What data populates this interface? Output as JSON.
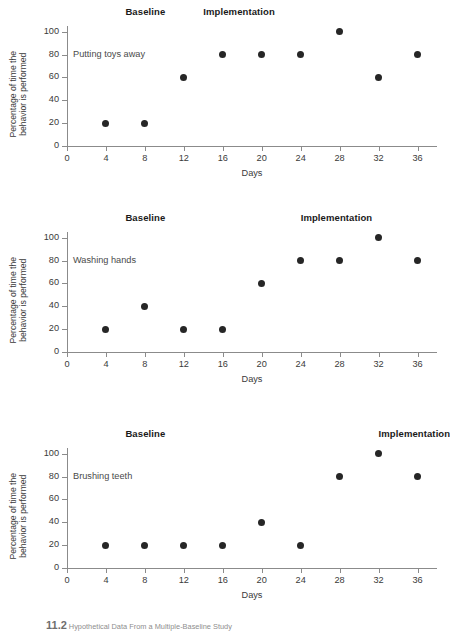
{
  "figure": {
    "caption_number": "11.2",
    "caption_text": "Hypothetical Data From a Multiple-Baseline Study"
  },
  "axes": {
    "xlabel": "Days",
    "ylabel_line1": "Percentage of time the",
    "ylabel_line2": "behavior is performed",
    "xticks": [
      0,
      4,
      8,
      12,
      16,
      20,
      24,
      28,
      32,
      36
    ],
    "yticks": [
      0,
      20,
      40,
      60,
      80,
      100
    ],
    "xlim": [
      0,
      38
    ],
    "ylim": [
      0,
      105
    ],
    "axis_color": "#8b8b8b",
    "marker_color": "#262626"
  },
  "phase_labels": {
    "baseline": "Baseline",
    "implementation": "Implementation"
  },
  "chart_data": [
    {
      "type": "scatter",
      "title": "Putting toys away",
      "xlabel": "Days",
      "ylabel": "Percentage of time the behavior is performed",
      "xlim": [
        0,
        38
      ],
      "ylim": [
        0,
        105
      ],
      "grid": false,
      "legend": "none",
      "x": [
        4,
        8,
        12,
        16,
        20,
        24,
        28,
        32,
        36
      ],
      "values": [
        20,
        20,
        60,
        80,
        80,
        80,
        100,
        60,
        80
      ],
      "annotations": {
        "baseline": "Baseline",
        "implementation": "Implementation",
        "baseline_x": 6,
        "implementation_x": 14
      }
    },
    {
      "type": "scatter",
      "title": "Washing hands",
      "xlabel": "Days",
      "ylabel": "Percentage of time the behavior is performed",
      "xlim": [
        0,
        38
      ],
      "ylim": [
        0,
        105
      ],
      "grid": false,
      "legend": "none",
      "x": [
        4,
        8,
        12,
        16,
        20,
        24,
        28,
        32,
        36
      ],
      "values": [
        20,
        40,
        20,
        20,
        60,
        80,
        80,
        100,
        80
      ],
      "annotations": {
        "baseline": "Baseline",
        "implementation": "Implementation",
        "baseline_x": 6,
        "implementation_x": 24
      }
    },
    {
      "type": "scatter",
      "title": "Brushing teeth",
      "xlabel": "Days",
      "ylabel": "Percentage of time the behavior is performed",
      "xlim": [
        0,
        38
      ],
      "ylim": [
        0,
        105
      ],
      "grid": false,
      "legend": "none",
      "x": [
        4,
        8,
        12,
        16,
        20,
        24,
        28,
        32,
        36
      ],
      "values": [
        20,
        20,
        20,
        20,
        40,
        20,
        80,
        100,
        80
      ],
      "annotations": {
        "baseline": "Baseline",
        "implementation": "Implementation",
        "baseline_x": 6,
        "implementation_x": 32
      }
    }
  ]
}
